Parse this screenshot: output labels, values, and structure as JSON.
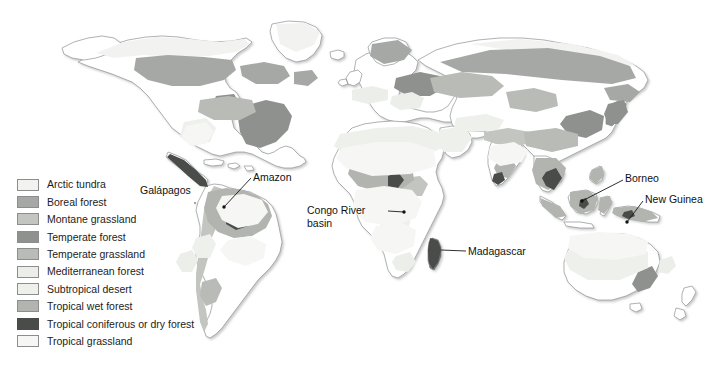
{
  "figure": {
    "type": "thematic-world-map",
    "caption": "",
    "projection": "Robinson-like world projection",
    "background_color": "#ffffff",
    "country_outline_color": "#8f9296",
    "label_text_color": "#111111",
    "leader_line_color": "#1a1a1a"
  },
  "legend": {
    "title": "",
    "items": [
      {
        "label": "Arctic tundra",
        "color": "#f2f2f0",
        "border": "#8d8d8d"
      },
      {
        "label": "Boreal forest",
        "color": "#a6a8a6",
        "border": "#8d8d8d"
      },
      {
        "label": "Montane grassland",
        "color": "#c3c5c1",
        "border": "#8d8d8d"
      },
      {
        "label": "Temperate forest",
        "color": "#8e918e",
        "border": "#8d8d8d"
      },
      {
        "label": "Temperate grassland",
        "color": "#b9bbb7",
        "border": "#8d8d8d"
      },
      {
        "label": "Mediterranean forest",
        "color": "#eceeea",
        "border": "#8d8d8d"
      },
      {
        "label": "Subtropical desert",
        "color": "#eef0ec",
        "border": "#8d8d8d"
      },
      {
        "label": "Tropical wet forest",
        "color": "#b2b4b0",
        "border": "#8d8d8d"
      },
      {
        "label": "Tropical coniferous or dry forest",
        "color": "#4a4c4a",
        "border": "#4a4c4a"
      },
      {
        "label": "Tropical grassland",
        "color": "#f6f7f4",
        "border": "#8d8d8d"
      }
    ]
  },
  "annotations": [
    {
      "id": "galapagos",
      "label": "Galápagos",
      "marker_x": 212,
      "marker_y": 206,
      "lines": 1
    },
    {
      "id": "amazon",
      "label": "Amazon",
      "marker_x": 224,
      "marker_y": 207,
      "lines": 1
    },
    {
      "id": "congo",
      "label": "Congo River basin",
      "marker_x": 404,
      "marker_y": 212,
      "lines": 2
    },
    {
      "id": "madagascar",
      "label": "Madagascar",
      "marker_x": 441,
      "marker_y": 250,
      "lines": 1
    },
    {
      "id": "borneo",
      "label": "Borneo",
      "marker_x": 582,
      "marker_y": 201,
      "lines": 1
    },
    {
      "id": "newguinea",
      "label": "New Guinea",
      "marker_x": 627,
      "marker_y": 222,
      "lines": 1
    }
  ]
}
